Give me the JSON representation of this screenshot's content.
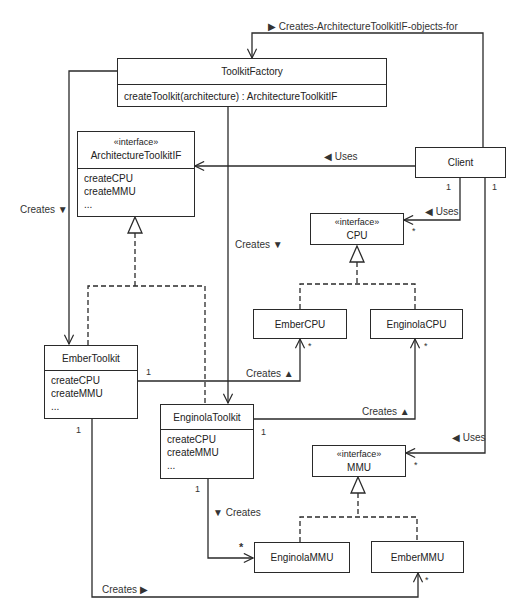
{
  "diagram": {
    "type": "UML class diagram (Abstract Factory)",
    "classes": {
      "toolkit_factory": {
        "name": "ToolkitFactory",
        "operations": [
          "createToolkit(architecture) : ArchitectureToolkitIF"
        ]
      },
      "architecture_toolkit_if": {
        "stereotype": "«interface»",
        "name": "ArchitectureToolkitIF",
        "operations": [
          "createCPU",
          "createMMU",
          "..."
        ]
      },
      "client": {
        "name": "Client"
      },
      "cpu_if": {
        "stereotype": "«interface»",
        "name": "CPU"
      },
      "ember_cpu": {
        "name": "EmberCPU"
      },
      "enginola_cpu": {
        "name": "EnginolaCPU"
      },
      "ember_toolkit": {
        "name": "EmberToolkit",
        "operations": [
          "createCPU",
          "createMMU",
          "..."
        ]
      },
      "enginola_toolkit": {
        "name": "EnginolaToolkit",
        "operations": [
          "createCPU",
          "createMMU",
          "..."
        ]
      },
      "mmu_if": {
        "stereotype": "«interface»",
        "name": "MMU"
      },
      "enginola_mmu": {
        "name": "EnginolaMMU"
      },
      "ember_mmu": {
        "name": "EmberMMU"
      }
    },
    "labels": {
      "creates_objects_for": "▶ Creates-ArchitectureToolkitIF-objects-for",
      "uses_toolkit": "◀ Uses",
      "uses_cpu": "◀ Uses",
      "uses_mmu": "◀ Uses",
      "creates_ember_toolkit": "Creates ▼",
      "creates_enginola_toolkit": "Creates ▼",
      "creates_ember_cpu": "Creates ▲",
      "creates_enginola_cpu": "Creates ▲",
      "creates_enginola_mmu": "▼ Creates",
      "creates_ember_mmu": "Creates ▶"
    },
    "multiplicities": {
      "client_cpu_one": "1",
      "client_mmu_one": "1",
      "cpu_many": "*",
      "mmu_many": "*",
      "ember_toolkit_cpu_one": "1",
      "ember_cpu_many": "*",
      "enginola_toolkit_cpu_one": "1",
      "enginola_cpu_many": "*",
      "ember_toolkit_mmu_one": "1",
      "ember_mmu_many": "*",
      "enginola_toolkit_mmu_one": "1",
      "enginola_mmu_many": "*"
    },
    "colors": {
      "line": "#2a2a2a",
      "background": "#ffffff",
      "text": "#222222"
    }
  }
}
